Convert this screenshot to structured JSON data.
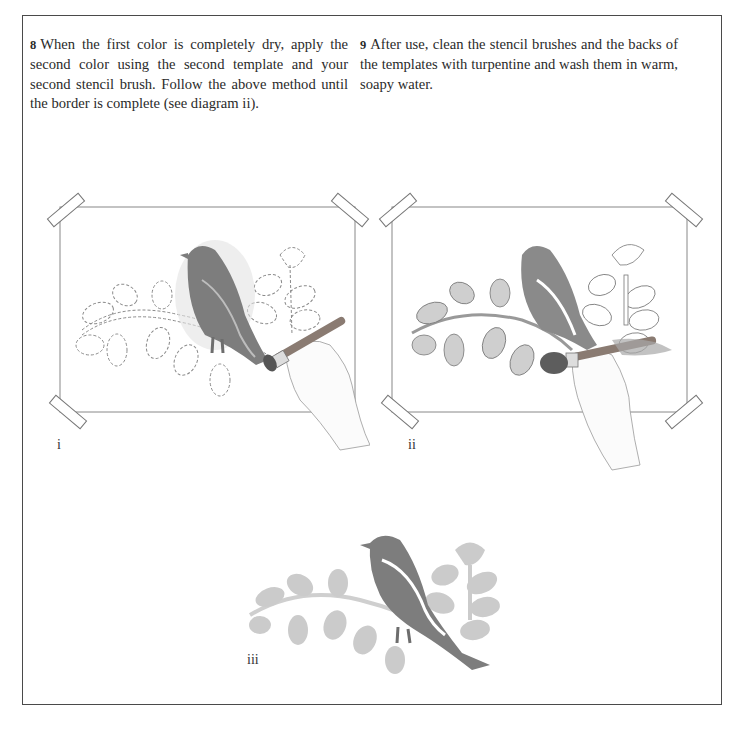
{
  "steps": [
    {
      "number": "8",
      "text": "When the first color is completely dry, apply the second color using the second template and your second stencil brush. Follow the above method until the border is complete (see diagram ii)."
    },
    {
      "number": "9",
      "text": "After use, clean the stencil brushes and the backs of the templates with turpentine and wash them in warm, soapy water."
    }
  ],
  "figures": [
    {
      "label": "i",
      "description": "Hand stenciling the bird with the first color through the taped template; leaves and branch shown as dashed outlines"
    },
    {
      "label": "ii",
      "description": "Hand stenciling the leaves and branch with the second color using the second template and brush"
    },
    {
      "label": "iii",
      "description": "Finished stencil border: dark bird perched on a light leafy branch with a rosebud"
    }
  ],
  "colors": {
    "bird": "#7d7d7d",
    "leaves_light": "#c9c9c9",
    "outline": "#8a8a8a",
    "frame": "#4a4a4a"
  }
}
